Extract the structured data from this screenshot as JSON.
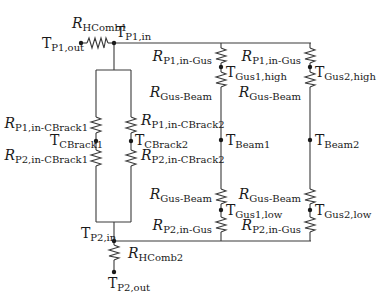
{
  "diagram": {
    "type": "thermal-resistance-network",
    "nodes": {
      "p1_out": {
        "main": "T",
        "sub": "P1,out"
      },
      "p1_in": {
        "main": "T",
        "sub": "P1,in"
      },
      "p2_in": {
        "main": "T",
        "sub": "P2,in"
      },
      "p2_out": {
        "main": "T",
        "sub": "P2,out"
      },
      "cbrack1": {
        "main": "T",
        "sub": "CBrack1"
      },
      "cbrack2": {
        "main": "T",
        "sub": "CBrack2"
      },
      "gus1_high": {
        "main": "T",
        "sub": "Gus1,high"
      },
      "gus2_high": {
        "main": "T",
        "sub": "Gus2,high"
      },
      "beam1": {
        "main": "T",
        "sub": "Beam1"
      },
      "beam2": {
        "main": "T",
        "sub": "Beam2"
      },
      "gus1_low": {
        "main": "T",
        "sub": "Gus1,low"
      },
      "gus2_low": {
        "main": "T",
        "sub": "Gus2,low"
      }
    },
    "resistors": {
      "hcomb1": {
        "main": "R",
        "sub": "HComb1"
      },
      "hcomb2": {
        "main": "R",
        "sub": "HComb2"
      },
      "p1_cbrack1": {
        "main": "R",
        "sub": "P1,in-CBrack1"
      },
      "p2_cbrack1": {
        "main": "R",
        "sub": "P2,in-CBrack1"
      },
      "p1_cbrack2": {
        "main": "R",
        "sub": "P1,in-CBrack2"
      },
      "p2_cbrack2": {
        "main": "R",
        "sub": "P2,in-CBrack2"
      },
      "p1_gus_col1": {
        "main": "R",
        "sub": "P1,in-Gus"
      },
      "gus_beam_high_col1": {
        "main": "R",
        "sub": "Gus-Beam"
      },
      "gus_beam_low_col1": {
        "main": "R",
        "sub": "Gus-Beam"
      },
      "p2_gus_col1": {
        "main": "R",
        "sub": "P2,in-Gus"
      },
      "p1_gus_col2": {
        "main": "R",
        "sub": "P1,in-Gus"
      },
      "gus_beam_high_col2": {
        "main": "R",
        "sub": "Gus-Beam"
      },
      "gus_beam_low_col2": {
        "main": "R",
        "sub": "Gus-Beam"
      },
      "p2_gus_col2": {
        "main": "R",
        "sub": "P2,in-Gus"
      }
    }
  }
}
